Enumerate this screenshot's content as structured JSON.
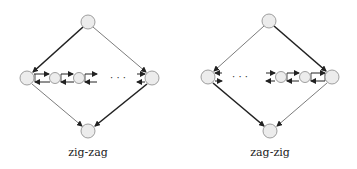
{
  "diagrams": [
    {
      "name": "zig-zag",
      "label": "zig-zag",
      "nodes": {
        "top": {
          "x": 88,
          "y": 22
        },
        "left": {
          "x": 27,
          "y": 78
        },
        "right": {
          "x": 152,
          "y": 78
        },
        "bottom": {
          "x": 88,
          "y": 131
        },
        "chain": [
          {
            "x": 55,
            "y": 78
          },
          {
            "x": 79,
            "y": 78
          }
        ]
      },
      "ellipsis": "· · ·"
    },
    {
      "name": "zag-zig",
      "label": "zag-zig",
      "nodes": {
        "top": {
          "x": 269,
          "y": 21
        },
        "left": {
          "x": 208,
          "y": 77
        },
        "right": {
          "x": 332,
          "y": 77
        },
        "bottom": {
          "x": 270,
          "y": 131
        },
        "chain": [
          {
            "x": 281,
            "y": 77
          },
          {
            "x": 305,
            "y": 77
          }
        ]
      },
      "ellipsis": "· · ·"
    }
  ],
  "colors": {
    "node_fill": "#ececec",
    "node_stroke": "#888888",
    "edge": "#222222"
  }
}
